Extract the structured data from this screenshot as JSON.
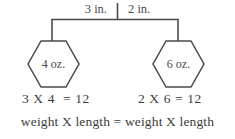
{
  "diagram": {
    "type": "balance-scale-lever-diagram",
    "top_measurements": {
      "left_distance": "3 in.",
      "right_distance": "2 in."
    },
    "weights": {
      "left": "4 oz.",
      "right": "6 oz."
    },
    "equations": {
      "left": "3 X 4  = 12",
      "right": "2 X 6 = 12"
    },
    "summary": {
      "left_expression": "weight X length",
      "equals": "=",
      "right_expression": "weight X length",
      "full": "weight X length = weight X length"
    },
    "colors": {
      "line": "#4a4a4a",
      "text": "#4a4a4a",
      "background": "#ffffff"
    }
  }
}
